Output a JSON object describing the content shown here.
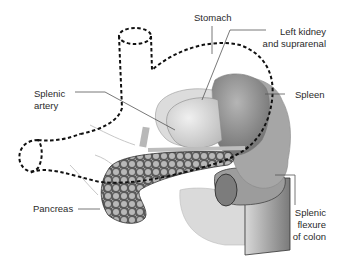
{
  "diagram": {
    "labels": {
      "stomach": "Stomach",
      "left_kidney_1": "Left kidney",
      "left_kidney_2": "and suprarenal",
      "splenic_artery_1": "Splenic",
      "splenic_artery_2": "artery",
      "spleen": "Spleen",
      "pancreas": "Pancreas",
      "splenic_flexure_1": "Splenic",
      "splenic_flexure_2": "flexure",
      "splenic_flexure_3": "of colon"
    },
    "colors": {
      "outline_dashed": "#111111",
      "leader_line": "#555555",
      "spleen": "#8a8a8a",
      "kidney": "#cfcfcf",
      "pancreas": "#6a6a6a",
      "colon": "#9a9a9a"
    }
  }
}
